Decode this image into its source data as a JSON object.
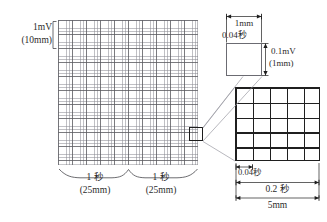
{
  "figure": {
    "colors": {
      "grid_fine": "#8c8c94",
      "grid_bold": "#5a5a5f",
      "detail_outline": "#1f1f1f",
      "text": "#2b2b2b",
      "leader_line": "#9a9aa2"
    }
  },
  "main_grid": {
    "name": "ecg-grid",
    "voltage_label": {
      "value": "1mV",
      "sub": "(10mm)"
    },
    "time_labels": [
      {
        "value": "1 秒",
        "sub": "(25mm)"
      },
      {
        "value": "1 秒",
        "sub": "(25mm)"
      }
    ]
  },
  "single_cell_detail": {
    "name": "one-small-square",
    "width_label": "1mm",
    "width_time_label": "0.04秒",
    "height_label": "0.1mV",
    "height_sub_label": "(1mm)"
  },
  "big_grid_detail": {
    "name": "five-by-five-block",
    "rows": 5,
    "cols": 5,
    "small_cell_time": "0.04秒",
    "block_time": "0.2 秒",
    "block_width": "5mm"
  }
}
